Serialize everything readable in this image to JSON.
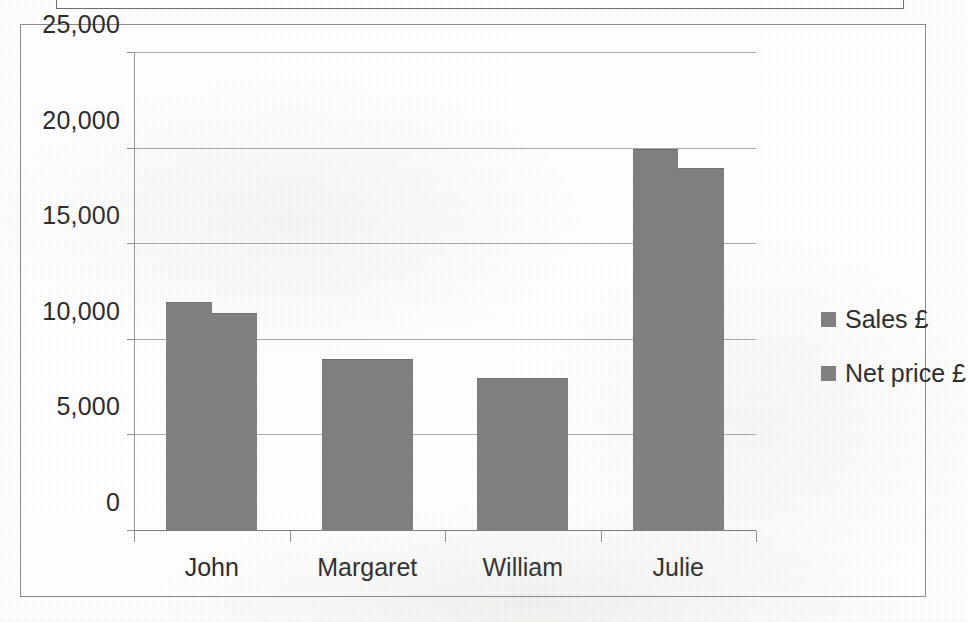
{
  "chart_data": {
    "type": "bar",
    "title": "",
    "subtitle": "",
    "xlabel": "",
    "ylabel": "",
    "categories": [
      "John",
      "Margaret",
      "William",
      "Julie"
    ],
    "series": [
      {
        "name": "Sales £",
        "values": [
          12000,
          9000,
          8000,
          20000
        ]
      },
      {
        "name": "Net price £",
        "values": [
          11400,
          9000,
          8000,
          19000
        ]
      }
    ],
    "ylim": [
      0,
      25000
    ],
    "ytick_values": [
      0,
      5000,
      10000,
      15000,
      20000,
      25000
    ],
    "ytick_labels": [
      "0",
      "5,000",
      "10,000",
      "15,000",
      "20,000",
      "25,000"
    ],
    "grid": "horizontal",
    "legend_position": "right",
    "bar_color": "#7f7f7f",
    "plot_background": "#ffffff",
    "gridline_color": "#a9a9a9",
    "axis_color": "#8f8f8f",
    "text_color": "#2b2b2b",
    "annotations": []
  },
  "legend": {
    "items": [
      {
        "label": "Sales £",
        "swatch": "legend-swatch-icon",
        "color": "#7f7f7f"
      },
      {
        "label": "Net price £",
        "swatch": "legend-swatch-icon",
        "color": "#7f7f7f"
      }
    ]
  },
  "page": {
    "background": "#fdfdfb",
    "frame_border_color": "#8a8a8a"
  }
}
